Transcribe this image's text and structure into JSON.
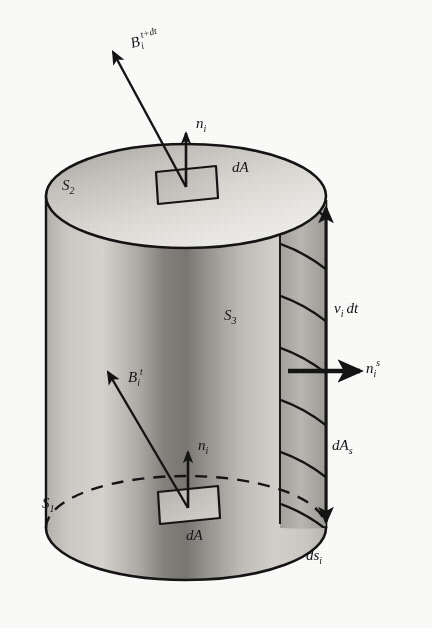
{
  "figure": {
    "background_color": "#fdfdfc",
    "ink_color": "#141414"
  },
  "labels": {
    "b_field_future": {
      "base": "B",
      "sub": "i",
      "sup": "t+dt"
    },
    "b_field_now": {
      "base": "B",
      "sub": "i",
      "sup": "t"
    },
    "normal_top": {
      "base": "n",
      "sub": "i",
      "sup": ""
    },
    "normal_bottom": {
      "base": "n",
      "sub": "i",
      "sup": ""
    },
    "normal_side": {
      "base": "n",
      "sub": "i",
      "sup": "s"
    },
    "area_top": {
      "base": "dA",
      "sub": "",
      "sup": ""
    },
    "area_bottom": {
      "base": "dA",
      "sub": "",
      "sup": ""
    },
    "area_side": {
      "base": "dA",
      "sub": "s",
      "sup": ""
    },
    "surface_top": {
      "base": "S",
      "sub": "2",
      "sup": ""
    },
    "surface_side": {
      "base": "S",
      "sub": "3",
      "sup": ""
    },
    "surface_bottom": {
      "base": "S",
      "sub": "1",
      "sup": ""
    },
    "sweep_height": {
      "base": "v",
      "sub": "i",
      "sup": "",
      "trail": "dt"
    },
    "arc_length": {
      "base": "ds",
      "sub": "i",
      "sup": ""
    }
  },
  "geometry": {
    "cylinder": {
      "center_x": 186,
      "top_center_y": 196,
      "bottom_center_y": 528,
      "radius_x": 140,
      "radius_y": 52
    },
    "sweep_strip": {
      "left_x": 280,
      "right_x": 326,
      "band_count": 6
    },
    "patch_top": {
      "cx": 186,
      "cy": 185,
      "w": 58,
      "h": 26
    },
    "patch_bottom": {
      "cx": 187,
      "cy": 505,
      "w": 58,
      "h": 26
    }
  },
  "colors": {
    "shade_light": "#e8e6e2",
    "shade_mid": "#c9c6c1",
    "shade_dark": "#8e8b87",
    "shade_darkest": "#6e6b67",
    "strip_fill": "#b9b6b1"
  }
}
